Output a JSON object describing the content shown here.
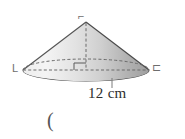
{
  "figure": {
    "name": "cone-diagram",
    "shape_type": "cone",
    "background_color": "#ffffff",
    "outline_color": "#4a4a4a",
    "fill_light": "#f2f2f2",
    "fill_mid": "#d9d9d9",
    "fill_dark": "#a9a9a9",
    "base_fill": "#d2d2d2"
  },
  "labels": {
    "apex_vertex_mark": "⌐",
    "left_vertex_mark": "L",
    "right_vertex_mark": "⊏",
    "dimension": "12 cm",
    "trailing_paren": "("
  },
  "measurements": {
    "diameter_value": "12",
    "diameter_unit": "cm",
    "diameter_label": "12 cm"
  },
  "geometry": {
    "apex_x": 86,
    "apex_y": 22,
    "base_center_x": 86,
    "base_center_y": 70,
    "base_rx": 63,
    "base_ry": 11,
    "height_line": "dashed",
    "back_edge": "dashed",
    "right_angle_mark": true
  }
}
